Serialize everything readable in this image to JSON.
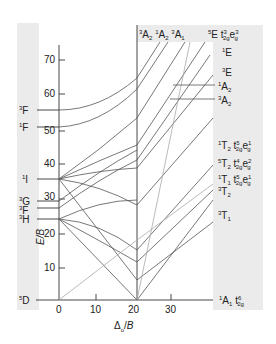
{
  "diagram": {
    "type": "Tanabe-Sugano diagram (d6)",
    "y_axis": {
      "label": "E/B",
      "ticks": [
        "10",
        "20",
        "30",
        "40",
        "50",
        "60",
        "70"
      ]
    },
    "x_axis": {
      "label": "Δo/B",
      "ticks": [
        "0",
        "10",
        "20",
        "30"
      ]
    },
    "left_terms": [
      {
        "term": "3F",
        "sup": "3",
        "base": "F"
      },
      {
        "term": "1F",
        "sup": "1",
        "base": "F"
      },
      {
        "term": "1I",
        "sup": "1",
        "base": "I"
      },
      {
        "term": "3G",
        "sup": "3",
        "base": "G"
      },
      {
        "term": "3F",
        "sup": "3",
        "base": "F"
      },
      {
        "term": "3H",
        "sup": "3",
        "base": "H"
      },
      {
        "term": "5D",
        "sup": "5",
        "base": "D"
      }
    ],
    "top_terms": [
      "3A2",
      "1A2",
      "3A1"
    ],
    "right_terms": [
      {
        "label": "5E t2g3 eg3"
      },
      {
        "label": "1E"
      },
      {
        "label": "3E"
      },
      {
        "label": "1A2"
      },
      {
        "label": "3A2"
      },
      {
        "label": "1T2 t2g5 eg1"
      },
      {
        "label": "5T2 t2g4 eg2"
      },
      {
        "label": "1T1 t2g5 eg1"
      },
      {
        "label": "3T2"
      },
      {
        "label": "3T1"
      },
      {
        "label": "1A1 t2g6"
      }
    ],
    "colors": {
      "band": "#ebebeb",
      "line": "#555555",
      "light_line": "#aaaaaa"
    }
  }
}
